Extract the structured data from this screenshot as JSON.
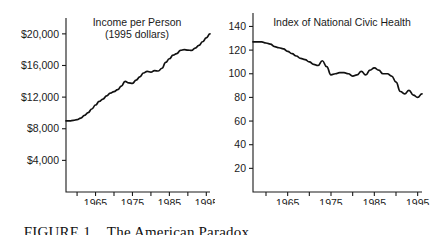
{
  "caption": {
    "label": "FIGURE 1",
    "title": "The American Paradox"
  },
  "chart_data": [
    {
      "type": "line",
      "panel": "left",
      "title": "Income per Person",
      "subtitle": "(1995 dollars)",
      "xlabel": "",
      "ylabel": "",
      "xlim": [
        1957,
        1996
      ],
      "ylim": [
        0,
        21500
      ],
      "grid": false,
      "legend": "none",
      "ytick_values": [
        4000,
        8000,
        12000,
        16000,
        20000
      ],
      "ytick_labels": [
        "$4,000",
        "$8,000",
        "$12,000",
        "$16,000",
        "$20,000"
      ],
      "xtick_values": [
        1960,
        1965,
        1970,
        1975,
        1980,
        1985,
        1990,
        1995
      ],
      "xtick_labels": [
        "",
        "1965",
        "",
        "1975",
        "",
        "1985",
        "",
        "1995"
      ],
      "x": [
        1957,
        1958,
        1959,
        1960,
        1961,
        1962,
        1963,
        1964,
        1965,
        1966,
        1967,
        1968,
        1969,
        1970,
        1971,
        1972,
        1973,
        1974,
        1975,
        1976,
        1977,
        1978,
        1979,
        1980,
        1981,
        1982,
        1983,
        1984,
        1985,
        1986,
        1987,
        1988,
        1989,
        1990,
        1991,
        1992,
        1993,
        1994,
        1995,
        1996
      ],
      "values": [
        9000,
        9000,
        9050,
        9150,
        9350,
        9700,
        10050,
        10500,
        11000,
        11450,
        11750,
        12150,
        12500,
        12700,
        12950,
        13400,
        14000,
        13800,
        13750,
        14150,
        14550,
        15050,
        15250,
        15150,
        15350,
        15300,
        15650,
        16400,
        16850,
        17300,
        17500,
        17900,
        18000,
        17950,
        17900,
        18200,
        18550,
        19000,
        19500,
        20000
      ]
    },
    {
      "type": "line",
      "panel": "right",
      "title": "Index of National Civic Health",
      "subtitle": "",
      "xlabel": "",
      "ylabel": "",
      "xlim": [
        1957,
        1996
      ],
      "ylim": [
        0,
        148
      ],
      "grid": false,
      "legend": "none",
      "ytick_values": [
        20,
        40,
        60,
        80,
        100,
        120,
        140
      ],
      "ytick_labels": [
        "20",
        "40",
        "60",
        "80",
        "100",
        "120",
        "140"
      ],
      "xtick_values": [
        1960,
        1965,
        1970,
        1975,
        1980,
        1985,
        1990,
        1995
      ],
      "xtick_labels": [
        "",
        "1965",
        "",
        "1975",
        "",
        "1985",
        "",
        "1995"
      ],
      "x": [
        1957,
        1958,
        1959,
        1960,
        1961,
        1962,
        1963,
        1964,
        1965,
        1966,
        1967,
        1968,
        1969,
        1970,
        1971,
        1972,
        1973,
        1974,
        1975,
        1976,
        1977,
        1978,
        1979,
        1980,
        1981,
        1982,
        1983,
        1984,
        1985,
        1986,
        1987,
        1988,
        1989,
        1990,
        1991,
        1992,
        1993,
        1994,
        1995,
        1996
      ],
      "values": [
        127,
        127,
        127,
        126,
        125,
        123,
        122,
        121,
        119,
        117,
        115,
        113,
        112,
        110,
        108,
        107,
        111,
        106,
        99,
        100,
        101,
        101,
        100,
        98,
        99,
        102,
        99,
        103,
        105,
        103,
        100,
        100,
        98,
        93,
        85,
        83,
        86,
        82,
        80,
        83
      ]
    }
  ]
}
